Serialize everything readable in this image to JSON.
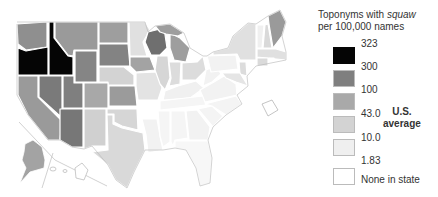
{
  "legend": {
    "title_line1_prefix": "Toponyms with ",
    "title_line1_italic": "squaw",
    "title_line2": "per 100,000 names",
    "ticks": [
      "323",
      "300",
      "100",
      "43.0",
      "10.0",
      "1.83"
    ],
    "swatch_colors": [
      "#050505",
      "#7f7f7f",
      "#a9a9a9",
      "#d0d0d0",
      "#ededed",
      "#ffffff"
    ],
    "average_label_line1": "U.S.",
    "average_label_line2": "average",
    "none_label": "None in state"
  },
  "map": {
    "subject": "United States choropleth by state",
    "colors": {
      "class_323": "#050505",
      "class_300": "#7f7f7f",
      "class_100": "#a9a9a9",
      "class_43": "#d0d0d0",
      "class_10": "#ededed",
      "none": "#ffffff",
      "border": "#ffffff",
      "outline": "#b5b5b5"
    }
  }
}
